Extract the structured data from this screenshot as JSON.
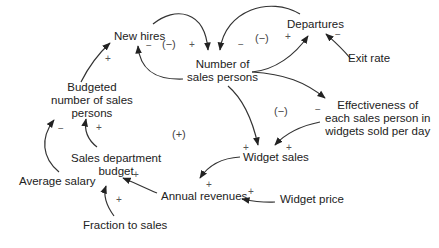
{
  "diagram": {
    "type": "causal-loop",
    "nodes": {
      "new_hires": "New hires",
      "num_sales_persons_1": "Number of",
      "num_sales_persons_2": "sales persons",
      "departures": "Departures",
      "exit_rate": "Exit rate",
      "budgeted_1": "Budgeted",
      "budgeted_2": "number of sales",
      "budgeted_3": "persons",
      "effectiveness_1": "Effectiveness of",
      "effectiveness_2": "each sales person in",
      "effectiveness_3": "widgets sold per day",
      "widget_sales": "Widget sales",
      "sales_budget_1": "Sales department",
      "sales_budget_2": "budget",
      "average_salary": "Average salary",
      "annual_revenues": "Annual revenues",
      "widget_price": "Widget price",
      "fraction_to_sales": "Fraction to sales"
    },
    "loops": {
      "hiring_loop": "(−)",
      "departures_loop": "(−)",
      "effectiveness_loop": "(−)",
      "growth_loop": "(+)"
    },
    "signs": {
      "hires_to_num": "+",
      "num_to_hires": "−",
      "dep_to_num": "−",
      "num_to_dep": "+",
      "exit_to_dep": "−",
      "num_to_eff": "−",
      "num_to_sales": "+",
      "eff_to_sales": "+",
      "sales_to_rev": "+",
      "price_to_rev": "+",
      "rev_to_budget": "+",
      "fraction_to_budget": "+",
      "budget_to_budgeted": "+",
      "salary_to_budgeted": "−",
      "budgeted_to_hires": "+"
    },
    "links": [
      {
        "from": "New hires",
        "to": "Number of sales persons",
        "polarity": "+"
      },
      {
        "from": "Number of sales persons",
        "to": "New hires",
        "polarity": "-"
      },
      {
        "from": "Departures",
        "to": "Number of sales persons",
        "polarity": "-"
      },
      {
        "from": "Number of sales persons",
        "to": "Departures",
        "polarity": "+"
      },
      {
        "from": "Exit rate",
        "to": "Departures",
        "polarity": "-"
      },
      {
        "from": "Number of sales persons",
        "to": "Effectiveness of each sales person in widgets sold per day",
        "polarity": "-"
      },
      {
        "from": "Number of sales persons",
        "to": "Widget sales",
        "polarity": "+"
      },
      {
        "from": "Effectiveness of each sales person in widgets sold per day",
        "to": "Widget sales",
        "polarity": "+"
      },
      {
        "from": "Widget sales",
        "to": "Annual revenues",
        "polarity": "+"
      },
      {
        "from": "Widget price",
        "to": "Annual revenues",
        "polarity": "+"
      },
      {
        "from": "Annual revenues",
        "to": "Sales department budget",
        "polarity": "+"
      },
      {
        "from": "Fraction to sales",
        "to": "Sales department budget",
        "polarity": "+"
      },
      {
        "from": "Sales department budget",
        "to": "Budgeted number of sales persons",
        "polarity": "+"
      },
      {
        "from": "Average salary",
        "to": "Budgeted number of sales persons",
        "polarity": "-"
      },
      {
        "from": "Budgeted number of sales persons",
        "to": "New hires",
        "polarity": "+"
      }
    ],
    "colors": {
      "text": "#222222",
      "arrow": "#222222",
      "sign": "#555555",
      "background": "#ffffff"
    }
  }
}
